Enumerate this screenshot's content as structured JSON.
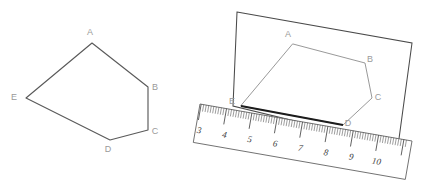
{
  "figure": {
    "background_color": "#ffffff",
    "width": 426,
    "height": 190,
    "panels": [
      {
        "id": "left-panel",
        "name": "plain-pentagon",
        "description": "Pentagon ABCDE drawn by itself",
        "vertices": [
          {
            "label": "A",
            "x": 92,
            "y": 43,
            "label_x": 90,
            "label_y": 35
          },
          {
            "label": "B",
            "x": 148,
            "y": 87,
            "label_x": 155,
            "label_y": 90
          },
          {
            "label": "C",
            "x": 148,
            "y": 130,
            "label_x": 155,
            "label_y": 134
          },
          {
            "label": "D",
            "x": 110,
            "y": 140,
            "label_x": 108,
            "label_y": 152
          },
          {
            "label": "E",
            "x": 26,
            "y": 98,
            "label_x": 14,
            "label_y": 100
          }
        ],
        "stroke_color": "#5a5a5a",
        "label_color": "#9a9a9a"
      },
      {
        "id": "right-panel",
        "name": "pentagon-on-ruler",
        "description": "Same pentagon on a sheet of paper with a tilted ruler measuring side ED",
        "vertices": [
          {
            "label": "A",
            "x": 293,
            "y": 44,
            "label_x": 288,
            "label_y": 37
          },
          {
            "label": "B",
            "x": 365,
            "y": 63,
            "label_x": 370,
            "label_y": 62
          },
          {
            "label": "C",
            "x": 372,
            "y": 98,
            "label_x": 378,
            "label_y": 100
          },
          {
            "label": "D",
            "x": 343,
            "y": 125,
            "label_x": 348,
            "label_y": 126
          },
          {
            "label": "E",
            "x": 241,
            "y": 106,
            "label_x": 232,
            "label_y": 104
          }
        ],
        "paper_corners": [
          {
            "x": 237,
            "y": 12
          },
          {
            "x": 412,
            "y": 43
          },
          {
            "x": 398,
            "y": 146
          },
          {
            "x": 233,
            "y": 106
          }
        ],
        "stroke_color": "#8d8d8d",
        "measured_edge_color": "#1c1c1c",
        "label_color": "#9a9a9a"
      }
    ],
    "ruler": {
      "name": "ruler",
      "numbers": [
        "3",
        "4",
        "5",
        "6",
        "7",
        "8",
        "9",
        "10"
      ],
      "number_color": "#3a3a3a",
      "tick_color": "#4c4c4c",
      "edge_color": "#6a6a6a",
      "start": {
        "x": 200,
        "y": 104
      },
      "end": {
        "x": 412,
        "y": 141
      },
      "thickness": 39,
      "first_number_value": 3,
      "last_number_value": 10,
      "minor_ticks_per_unit": 10,
      "measured_from": "E",
      "measured_to": "D",
      "reading_at_E": 3.5,
      "reading_at_D": 8.1
    }
  }
}
